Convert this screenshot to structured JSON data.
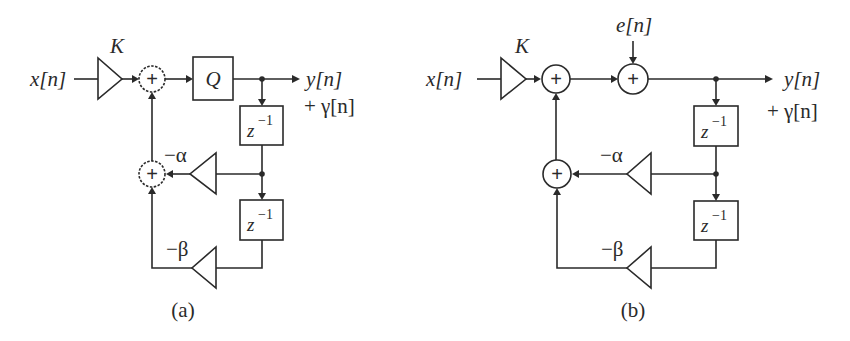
{
  "diagram_a": {
    "caption": "(a)",
    "input_label": "x[n]",
    "gain_label": "K",
    "quantizer_label": "Q",
    "output_label": "y[n]",
    "output_noise_label": "+ γ[n]",
    "delay1_label": "z",
    "delay1_exp": "−1",
    "delay2_label": "z",
    "delay2_exp": "−1",
    "alpha_gain_label": "−α",
    "beta_gain_label": "−β",
    "adder_symbol": "+"
  },
  "diagram_b": {
    "caption": "(b)",
    "input_label": "x[n]",
    "gain_label": "K",
    "noise_input_label": "e[n]",
    "output_label": "y[n]",
    "output_noise_label": "+ γ[n]",
    "delay1_label": "z",
    "delay1_exp": "−1",
    "delay2_label": "z",
    "delay2_exp": "−1",
    "alpha_gain_label": "−α",
    "beta_gain_label": "−β",
    "adder_symbol": "+"
  }
}
